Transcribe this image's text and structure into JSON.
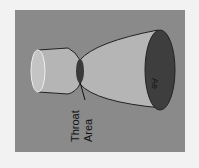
{
  "diagram": {
    "labels": {
      "throat_line1": "Throat",
      "throat_line2": "Area",
      "exit": "Ae"
    },
    "colors": {
      "background": "#8a8a8a",
      "nozzle_body": "#b5b5b5",
      "throat": "#3a3a3a",
      "exit_face": "#3e3e3e"
    }
  }
}
